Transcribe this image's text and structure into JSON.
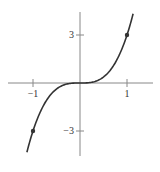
{
  "chart_data": {
    "type": "line",
    "title": "",
    "xlabel": "",
    "ylabel": "",
    "function": "y = 3x^3",
    "xlim": [
      -1.7,
      1.7
    ],
    "ylim": [
      -4.5,
      4.5
    ],
    "grid": false,
    "x_ticks": [
      -1,
      1
    ],
    "y_ticks": [
      -3,
      3
    ],
    "x_tick_labels": [
      "−1",
      "1"
    ],
    "y_tick_labels": [
      "−3",
      "3"
    ],
    "series": [
      {
        "name": "3x^3",
        "x": [
          -1.13,
          -1.0,
          -0.8,
          -0.6,
          -0.4,
          -0.2,
          0,
          0.2,
          0.4,
          0.6,
          0.8,
          1.0,
          1.13
        ],
        "values": [
          -4.33,
          -3,
          -1.536,
          -0.648,
          -0.192,
          -0.024,
          0,
          0.024,
          0.192,
          0.648,
          1.536,
          3,
          4.33
        ]
      }
    ],
    "marked_points": [
      {
        "x": -1,
        "y": -3
      },
      {
        "x": 1,
        "y": 3
      }
    ],
    "colors": {
      "axis": "#888888",
      "curve": "#333333",
      "point": "#333333"
    }
  }
}
